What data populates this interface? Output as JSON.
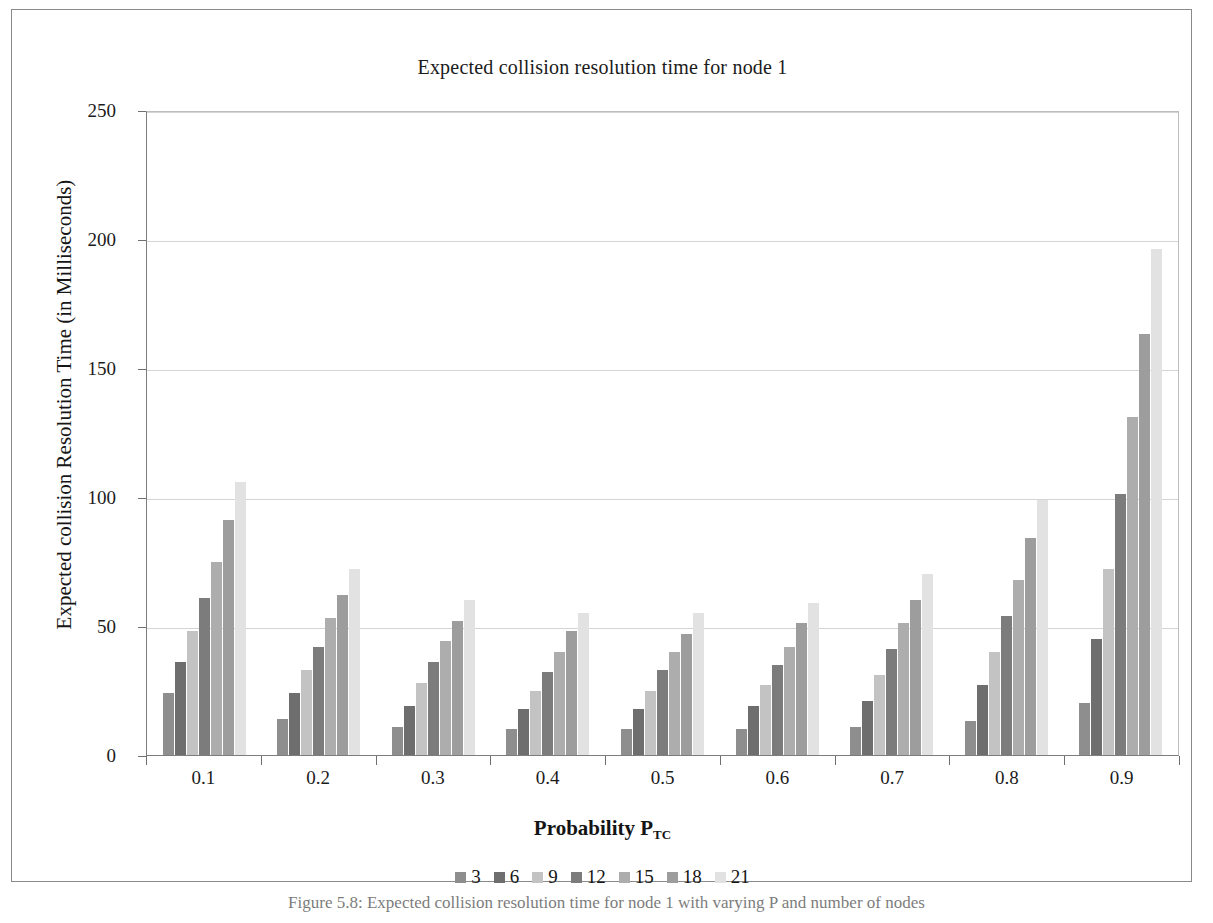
{
  "figure": {
    "title": "Expected collision resolution time for node 1",
    "caption": "Figure 5.8: Expected collision resolution time for node 1 with varying P and number of nodes"
  },
  "chart_data": {
    "type": "bar",
    "title": "Expected collision resolution time for node 1",
    "xlabel": "Probability P",
    "xlabel_subscript": "TC",
    "ylabel": "Expected collision Resolution Time (in Milliseconds)",
    "categories": [
      "0.1",
      "0.2",
      "0.3",
      "0.4",
      "0.5",
      "0.6",
      "0.7",
      "0.8",
      "0.9"
    ],
    "ylim": [
      0,
      250
    ],
    "yticks": [
      0,
      50,
      100,
      150,
      200,
      250
    ],
    "grid": true,
    "legend_position": "bottom",
    "legend_title": "Number of nodes",
    "series": [
      {
        "name": "3",
        "color": "#8e8e8e",
        "values": [
          24,
          14,
          11,
          10,
          10,
          10,
          11,
          13,
          20
        ]
      },
      {
        "name": "6",
        "color": "#6e6e6e",
        "values": [
          36,
          24,
          19,
          18,
          18,
          19,
          21,
          27,
          45
        ]
      },
      {
        "name": "9",
        "color": "#c3c3c3",
        "values": [
          48,
          33,
          28,
          25,
          25,
          27,
          31,
          40,
          72
        ]
      },
      {
        "name": "12",
        "color": "#7c7c7c",
        "values": [
          61,
          42,
          36,
          32,
          33,
          35,
          41,
          54,
          101
        ]
      },
      {
        "name": "15",
        "color": "#adadad",
        "values": [
          75,
          53,
          44,
          40,
          40,
          42,
          51,
          68,
          131
        ]
      },
      {
        "name": "18",
        "color": "#9d9d9d",
        "values": [
          91,
          62,
          52,
          48,
          47,
          51,
          60,
          84,
          163
        ]
      },
      {
        "name": "21",
        "color": "#e2e2e2",
        "values": [
          106,
          72,
          60,
          55,
          55,
          59,
          70,
          99,
          196
        ]
      }
    ]
  }
}
